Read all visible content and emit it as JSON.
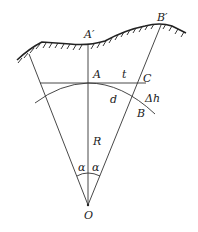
{
  "diagram": {
    "type": "geometric-figure",
    "labels": {
      "A_prime": "A′",
      "B_prime": "B′",
      "A": "A",
      "t": "t",
      "C": "C",
      "d": "d",
      "delta_h": "Δh",
      "B": "B",
      "R": "R",
      "alpha_left": "α",
      "alpha_right": "α",
      "O": "O"
    },
    "colors": {
      "line": "#333333",
      "ground": "#222222",
      "background": "#ffffff"
    }
  }
}
